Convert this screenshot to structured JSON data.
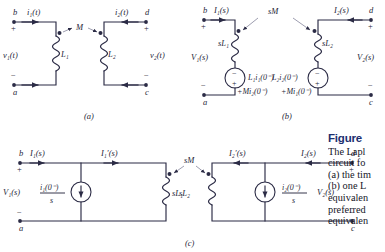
{
  "figure": {
    "heading": "Figure",
    "caption_lines": [
      "The Lapl",
      "circuit fo",
      "(a) the tim",
      "(b) one L",
      "equivalen",
      "preferred",
      "equivalen"
    ]
  },
  "subfigure_labels": {
    "a": "(a)",
    "b": "(b)",
    "c": "(c)"
  },
  "circuit_a": {
    "terminals": {
      "top_left": "b",
      "bottom_left": "a",
      "top_right": "d",
      "bottom_right": "c"
    },
    "signs": {
      "left_plus": "+",
      "left_minus": "−",
      "right_plus": "+",
      "right_minus": "−"
    },
    "currents": {
      "left": "i₁(t)",
      "right": "i₂(t)"
    },
    "voltages": {
      "left": "v₁(t)",
      "right": "v₂(t)"
    },
    "inductors": {
      "left": "L₁",
      "right": "L₂"
    },
    "mutual": "M"
  },
  "circuit_b": {
    "terminals": {
      "top_left": "b",
      "bottom_left": "a",
      "top_right": "d",
      "bottom_right": "c"
    },
    "signs": {
      "left_plus": "+",
      "left_minus": "−",
      "right_plus": "+",
      "right_minus": "−"
    },
    "currents": {
      "left": "I₁(s)",
      "right": "I₂(s)"
    },
    "voltages": {
      "left": "V₁(s)",
      "right": "V₂(s)"
    },
    "impedances": {
      "left": "sL₁",
      "right": "sL₂"
    },
    "mutual": "sM",
    "source_left": {
      "line1": "L₁i₁(0⁻)",
      "line2": "+Mi₂(0⁻)",
      "top_sign": "−",
      "bottom_sign": "+"
    },
    "source_right": {
      "line1": "L₂i₂(0⁻)",
      "line2": "+Mi₁(0⁻)",
      "top_sign": "−",
      "bottom_sign": "+"
    }
  },
  "circuit_c": {
    "terminals": {
      "top_left": "b",
      "bottom_left": "a",
      "top_right": "d",
      "bottom_right": "c"
    },
    "signs": {
      "left_plus": "+",
      "left_minus": "−",
      "right_plus": "+",
      "right_minus": "−"
    },
    "currents": {
      "left_outer": "I₁(s)",
      "left_inner": "I₁′(s)",
      "right_inner": "I₂′(s)",
      "right_outer": "I₂(s)"
    },
    "voltages": {
      "left": "V₁(s)",
      "right": "V₂(s)"
    },
    "impedances": {
      "left": "sL₁",
      "right": "sL₂"
    },
    "mutual": "sM",
    "source_left": {
      "numerator": "i₁(0⁻)",
      "denominator": "s"
    },
    "source_right": {
      "numerator": "i₂(0⁻)",
      "denominator": "s"
    }
  }
}
